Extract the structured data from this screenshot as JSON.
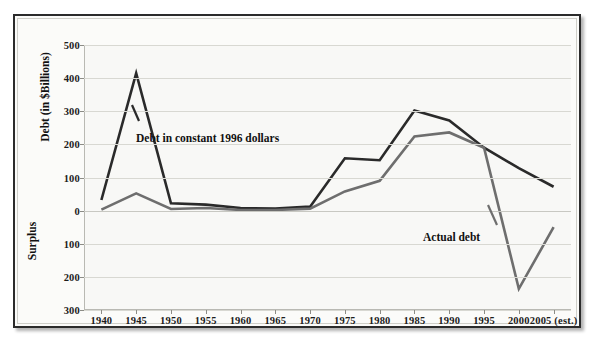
{
  "figure": {
    "background_color": "#fbfbf9",
    "frame_color": "#2b2b2b"
  },
  "chart_data": {
    "type": "line",
    "title": "",
    "xlabel": "",
    "ylabel": "Debt (in $Billions)",
    "ylabel_secondary": "Surplus",
    "grid": true,
    "legend_position": "inline-annotations",
    "categories": [
      "1940",
      "1945",
      "1950",
      "1955",
      "1960",
      "1965",
      "1970",
      "1975",
      "1980",
      "1985",
      "1990",
      "1995",
      "2000",
      "2005 (est.)"
    ],
    "x": [
      1940,
      1945,
      1950,
      1955,
      1960,
      1965,
      1970,
      1975,
      1980,
      1985,
      1990,
      1995,
      2000,
      2005
    ],
    "ylim": [
      -300,
      500
    ],
    "yticks": [
      500,
      400,
      300,
      200,
      100,
      0,
      -100,
      -200,
      -300
    ],
    "ytick_labels": [
      "500",
      "400",
      "300",
      "200",
      "100",
      "0",
      "100",
      "200",
      "300"
    ],
    "series": [
      {
        "name": "Debt in constant 1996 dollars",
        "color": "#2a2a2a",
        "width": 2.6,
        "values": [
          32,
          415,
          22,
          18,
          8,
          6,
          12,
          158,
          152,
          302,
          272,
          190,
          128,
          72
        ]
      },
      {
        "name": "Actual debt",
        "color": "#6e6e6e",
        "width": 2.6,
        "values": [
          3,
          52,
          5,
          8,
          2,
          2,
          6,
          58,
          90,
          224,
          236,
          190,
          -236,
          -50
        ]
      }
    ],
    "annotations": [
      {
        "text": "Debt in constant 1996 dollars",
        "series": "Debt in constant 1996 dollars"
      },
      {
        "text": "Actual debt",
        "series": "Actual debt"
      }
    ]
  }
}
